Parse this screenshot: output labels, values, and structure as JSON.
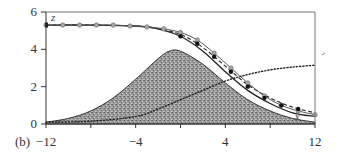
{
  "chart_data": {
    "type": "line",
    "title": "",
    "panel_label": "(b)",
    "xlabel": "x",
    "ylabel": "z",
    "xlim": [
      -12,
      12
    ],
    "ylim": [
      0,
      6
    ],
    "x_ticks": [
      -12,
      -8,
      -4,
      0,
      4,
      8,
      12
    ],
    "x_tick_labels": [
      "-12",
      "",
      "-4",
      "",
      "4",
      "",
      "12"
    ],
    "y_ticks": [
      0,
      2,
      4,
      6
    ],
    "y_tick_labels": [
      "0",
      "2",
      "4",
      "6"
    ],
    "grid": false,
    "legend": null,
    "series": [
      {
        "name": "shaded gaussian region",
        "style": "filled area (stippled gray)",
        "x": [
          -12,
          -10,
          -8,
          -6,
          -4,
          -2,
          -1,
          0,
          2,
          4,
          6,
          8,
          10,
          12
        ],
        "values": [
          0.1,
          0.3,
          0.7,
          1.4,
          2.4,
          3.5,
          3.9,
          3.9,
          3.2,
          2.2,
          1.3,
          0.7,
          0.3,
          0.1
        ]
      },
      {
        "name": "solid curve",
        "style": "solid black line",
        "x": [
          -12,
          -8,
          -4,
          -2,
          0,
          2,
          4,
          6,
          8,
          10,
          12
        ],
        "values": [
          5.3,
          5.3,
          5.25,
          5.1,
          4.7,
          3.9,
          2.8,
          1.8,
          1.1,
          0.6,
          0.4
        ]
      },
      {
        "name": "dashed curve",
        "style": "dashed black line",
        "x": [
          -12,
          -8,
          -4,
          -2,
          0,
          2,
          4,
          6,
          8,
          10,
          12
        ],
        "values": [
          5.3,
          5.3,
          5.25,
          5.1,
          4.8,
          4.1,
          3.1,
          2.1,
          1.4,
          0.9,
          0.6
        ]
      },
      {
        "name": "gray circle markers",
        "style": "gray circles",
        "x": [
          -12,
          -10.5,
          -9,
          -7.5,
          -6,
          -4.5,
          -3,
          -1.5,
          0,
          1.5,
          3,
          4.5,
          6,
          7.5,
          9,
          10.5,
          12
        ],
        "values": [
          5.3,
          5.3,
          5.3,
          5.3,
          5.3,
          5.25,
          5.2,
          5.1,
          4.9,
          4.5,
          3.8,
          3.0,
          2.2,
          1.5,
          1.0,
          0.7,
          0.5
        ]
      },
      {
        "name": "black filled markers",
        "style": "black dots",
        "x": [
          0,
          1.5,
          3,
          4.5,
          6,
          7.5,
          9,
          10.5
        ],
        "values": [
          4.7,
          4.3,
          3.6,
          2.8,
          2.0,
          1.4,
          1.0,
          0.8
        ]
      },
      {
        "name": "dotted rising curve",
        "style": "dotted black line",
        "x": [
          -12,
          -8,
          -4,
          -2,
          0,
          2,
          4,
          6,
          8,
          10,
          12
        ],
        "values": [
          0.1,
          0.15,
          0.4,
          0.8,
          1.3,
          1.8,
          2.3,
          2.65,
          2.9,
          3.05,
          3.15
        ]
      }
    ],
    "annotations": [
      {
        "text": "z",
        "near": "top-left of plot"
      },
      {
        "text": "x",
        "near": "bottom-right inside plot"
      }
    ]
  }
}
